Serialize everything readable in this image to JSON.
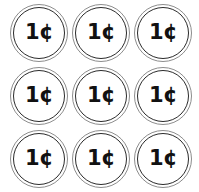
{
  "page": {
    "background_color": "#ffffff",
    "width": 199,
    "height": 192
  },
  "grid": {
    "rows": 3,
    "columns": 3,
    "total_items": 9
  },
  "coin_style": {
    "face_color": "#ffffff",
    "outer_ring_color": "#8c8c8c",
    "inner_ring_color": "#2b2b2b",
    "text_color": "#111111"
  },
  "coins": [
    {
      "label": "1¢",
      "value": 1,
      "unit": "cent",
      "row": 1,
      "column": 1
    },
    {
      "label": "1¢",
      "value": 1,
      "unit": "cent",
      "row": 1,
      "column": 2
    },
    {
      "label": "1¢",
      "value": 1,
      "unit": "cent",
      "row": 1,
      "column": 3
    },
    {
      "label": "1¢",
      "value": 1,
      "unit": "cent",
      "row": 2,
      "column": 1
    },
    {
      "label": "1¢",
      "value": 1,
      "unit": "cent",
      "row": 2,
      "column": 2
    },
    {
      "label": "1¢",
      "value": 1,
      "unit": "cent",
      "row": 2,
      "column": 3
    },
    {
      "label": "1¢",
      "value": 1,
      "unit": "cent",
      "row": 3,
      "column": 1
    },
    {
      "label": "1¢",
      "value": 1,
      "unit": "cent",
      "row": 3,
      "column": 2
    },
    {
      "label": "1¢",
      "value": 1,
      "unit": "cent",
      "row": 3,
      "column": 3
    }
  ]
}
